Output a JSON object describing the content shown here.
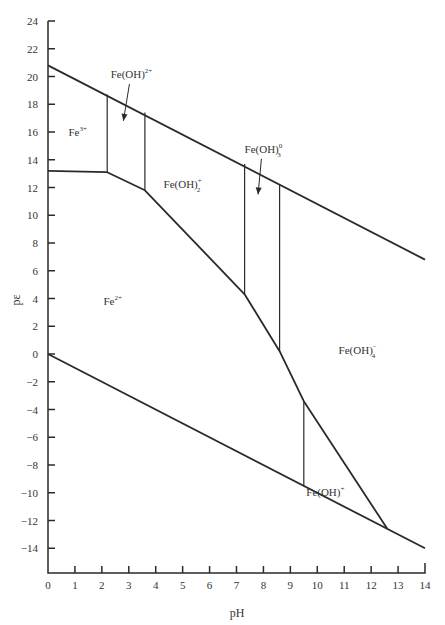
{
  "chart_data": {
    "type": "line",
    "title": "",
    "xlabel": "pH",
    "ylabel": "pε",
    "xlim": [
      0,
      14
    ],
    "ylim": [
      -16,
      24
    ],
    "grid": false,
    "x_ticks": [
      0,
      1,
      2,
      3,
      4,
      5,
      6,
      7,
      8,
      9,
      10,
      11,
      12,
      13,
      14
    ],
    "y_ticks": [
      24,
      22,
      20,
      18,
      16,
      14,
      12,
      10,
      8,
      6,
      4,
      2,
      0,
      -2,
      -4,
      -6,
      -8,
      -10,
      -12,
      -14
    ],
    "series": [
      {
        "name": "upper water stability line",
        "points": [
          [
            0,
            20.8
          ],
          [
            14,
            6.8
          ]
        ]
      },
      {
        "name": "lower water stability line",
        "points": [
          [
            0,
            0
          ],
          [
            14,
            -14
          ]
        ]
      },
      {
        "name": "Fe(III)/Fe(II) boundary",
        "points": [
          [
            0,
            13.2
          ],
          [
            2.2,
            13.1
          ],
          [
            3.6,
            11.8
          ],
          [
            7.3,
            4.3
          ],
          [
            8.6,
            0.2
          ],
          [
            9.5,
            -3.4
          ],
          [
            12.6,
            -12.6
          ]
        ]
      },
      {
        "name": "Fe3+/Fe(OH)2+ boundary",
        "points": [
          [
            2.2,
            13.1
          ],
          [
            2.2,
            18.7
          ]
        ]
      },
      {
        "name": "Fe(OH)2+/Fe(OH)2+ boundary",
        "points": [
          [
            3.6,
            11.8
          ],
          [
            3.6,
            17.4
          ]
        ]
      },
      {
        "name": "Fe(OH)2+/Fe(OH)3 boundary",
        "points": [
          [
            7.3,
            4.3
          ],
          [
            7.3,
            13.7
          ]
        ]
      },
      {
        "name": "Fe(OH)3/Fe(OH)4- boundary",
        "points": [
          [
            8.6,
            0.2
          ],
          [
            8.6,
            12.2
          ]
        ]
      },
      {
        "name": "Fe2+/Fe(OH)+ boundary",
        "points": [
          [
            9.5,
            -3.4
          ],
          [
            9.5,
            -9.5
          ]
        ]
      }
    ],
    "annotations": [
      {
        "text": "Fe3+",
        "base": "Fe",
        "sup": "3+",
        "sub": "",
        "x": 1.1,
        "y": 15.7
      },
      {
        "text": "Fe(OH)2+",
        "base": "Fe(OH)",
        "sup": "2+",
        "sub": "",
        "x": 3.1,
        "y": 19.9,
        "arrow_to": [
          2.8,
          16.8
        ]
      },
      {
        "text": "Fe(OH)2+",
        "base": "Fe(OH)",
        "sup": "+",
        "sub": "2",
        "x": 5.0,
        "y": 12.0
      },
      {
        "text": "Fe(OH)3 (aq)",
        "base": "Fe(OH)",
        "sup": "0",
        "sub": "3",
        "x": 8.0,
        "y": 14.5,
        "arrow_to": [
          7.8,
          11.5
        ]
      },
      {
        "text": "Fe2+",
        "base": "Fe",
        "sup": "2+",
        "sub": "",
        "x": 2.4,
        "y": 3.5
      },
      {
        "text": "Fe(OH)4-",
        "base": "Fe(OH)",
        "sup": "−",
        "sub": "4",
        "x": 11.5,
        "y": 0.0
      },
      {
        "text": "Fe(OH)+",
        "base": "Fe(OH)",
        "sup": "+",
        "sub": "",
        "x": 10.3,
        "y": -10.2
      }
    ]
  }
}
